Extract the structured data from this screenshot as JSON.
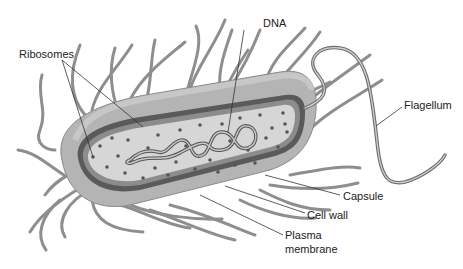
{
  "diagram": {
    "labels": {
      "ribosomes": "Ribosomes",
      "dna": "DNA",
      "flagellum": "Flagellum",
      "capsule": "Capsule",
      "cell_wall": "Cell wall",
      "plasma_membrane_line1": "Plasma",
      "plasma_membrane_line2": "membrane"
    },
    "colors": {
      "background": "#ffffff",
      "capsule_fill": "#b4b4b4",
      "capsule_top": "#c8c8c8",
      "cell_wall": "#5a5a5a",
      "membrane": "#8c8c8c",
      "cytoplasm": "#d6d6d6",
      "ribosome": "#555555",
      "dna": "#6a6a6a",
      "pili": "#9a9a9a",
      "leader_line": "#333333",
      "text": "#222222"
    }
  }
}
